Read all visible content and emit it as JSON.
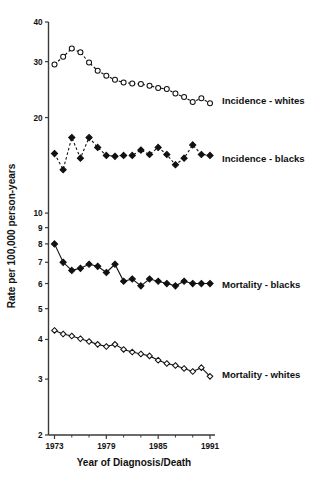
{
  "chart_data": {
    "type": "line",
    "title": "",
    "xlabel": "Year of Diagnosis/Death",
    "ylabel": "Rate per 100,000 person-years",
    "yscale": "log",
    "ylim": [
      2,
      40
    ],
    "xlim": [
      1973,
      1991
    ],
    "grid": false,
    "legend_position": "right-inline",
    "x_ticks": [
      1973,
      1979,
      1985,
      1991
    ],
    "x_tick_labels": [
      "1973",
      "1979",
      "1985",
      "1991"
    ],
    "y_ticks": [
      2,
      3,
      4,
      5,
      6,
      7,
      8,
      9,
      10,
      20,
      30,
      40
    ],
    "y_tick_labels": [
      "2",
      "3",
      "4",
      "5",
      "6",
      "7",
      "8",
      "9",
      "10",
      "20",
      "30",
      "40"
    ],
    "x": [
      1973,
      1974,
      1975,
      1976,
      1977,
      1978,
      1979,
      1980,
      1981,
      1982,
      1983,
      1984,
      1985,
      1986,
      1987,
      1988,
      1989,
      1990,
      1991
    ],
    "series": [
      {
        "name": "Incidence - whites",
        "marker": "open-circle",
        "linestyle": "dashed",
        "values": [
          29.4,
          31.1,
          33.0,
          32.1,
          29.8,
          28.1,
          27.1,
          26.3,
          25.8,
          25.6,
          25.5,
          25.2,
          24.8,
          24.6,
          23.8,
          23.2,
          22.4,
          23.0,
          22.2
        ]
      },
      {
        "name": "Incidence - blacks",
        "marker": "filled-diamond",
        "linestyle": "dashed",
        "values": [
          15.4,
          13.7,
          17.3,
          14.9,
          17.3,
          16.1,
          15.2,
          15.1,
          15.2,
          15.2,
          15.8,
          15.3,
          16.1,
          15.3,
          14.2,
          14.9,
          16.4,
          15.3,
          15.2
        ]
      },
      {
        "name": "Mortality - blacks",
        "marker": "filled-diamond",
        "linestyle": "solid",
        "values": [
          8.0,
          7.0,
          6.6,
          6.7,
          6.9,
          6.8,
          6.5,
          6.9,
          6.1,
          6.2,
          5.9,
          6.2,
          6.1,
          6.0,
          5.9,
          6.1,
          6.0,
          6.0,
          6.0
        ]
      },
      {
        "name": "Mortality - whites",
        "marker": "open-diamond",
        "linestyle": "solid",
        "values": [
          4.27,
          4.16,
          4.1,
          4.02,
          3.94,
          3.86,
          3.8,
          3.86,
          3.72,
          3.65,
          3.6,
          3.55,
          3.44,
          3.36,
          3.31,
          3.24,
          3.17,
          3.26,
          3.06
        ]
      }
    ],
    "annotations": [
      {
        "text": "Incidence - whites",
        "x": 1991.6,
        "y": 22.6
      },
      {
        "text": "Incidence - blacks",
        "x": 1991.6,
        "y": 14.9
      },
      {
        "text": "Mortality - blacks",
        "x": 1991.6,
        "y": 5.95
      },
      {
        "text": "Mortality - whites",
        "x": 1991.6,
        "y": 3.1
      }
    ]
  }
}
